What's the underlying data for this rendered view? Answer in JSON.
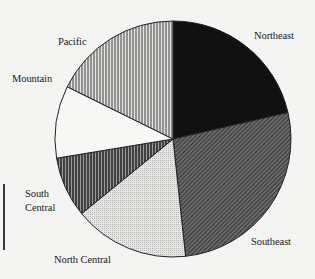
{
  "chart_data": {
    "type": "pie",
    "title": "",
    "start_angle_deg": 0,
    "direction": "clockwise",
    "slices": [
      {
        "label": "Northeast",
        "value": 21.4,
        "pattern": "solid-black"
      },
      {
        "label": "Southeast",
        "value": 26.9,
        "pattern": "dense-diagonal-dark"
      },
      {
        "label": "North Central",
        "value": 15.8,
        "pattern": "light-dotted-gray"
      },
      {
        "label": "South Central",
        "value": 8.3,
        "pattern": "vertical-stripes-dark"
      },
      {
        "label": "Mountain",
        "value": 9.9,
        "pattern": "white"
      },
      {
        "label": "Pacific",
        "value": 17.7,
        "pattern": "vertical-stripes-light"
      }
    ],
    "categories": [
      "Northeast",
      "Southeast",
      "North Central",
      "South Central",
      "Mountain",
      "Pacific"
    ],
    "values": [
      21.4,
      26.9,
      15.8,
      8.3,
      9.9,
      17.7
    ],
    "unit": "percent (estimated from slice angles)",
    "legend": "none (direct labels)"
  },
  "labels": {
    "northeast": "Northeast",
    "southeast": "Southeast",
    "north_central": "North Central",
    "south_central_line1": "South",
    "south_central_line2": "Central",
    "mountain": "Mountain",
    "pacific": "Pacific"
  }
}
